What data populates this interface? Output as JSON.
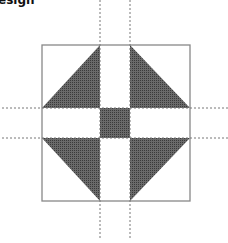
{
  "title": "esign",
  "diagram": {
    "type": "quilt-block",
    "outer_square": {
      "x": 42,
      "y": 45,
      "size": 148
    },
    "grid_lines": {
      "vertical_x": [
        100,
        130
      ],
      "horizontal_y": [
        108,
        138
      ]
    },
    "fill_color": "#555555",
    "stroke_color": "#888888",
    "dash_color": "#777777"
  }
}
